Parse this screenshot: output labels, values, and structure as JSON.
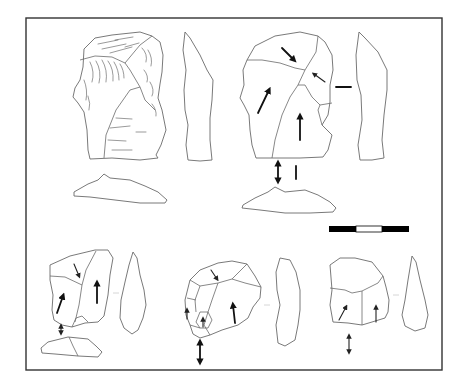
{
  "figure": {
    "type": "lithic-illustration",
    "frame": {
      "x": 26,
      "y": 18,
      "width": 416,
      "height": 352,
      "stroke": "#333333"
    },
    "scale_bar": {
      "x": 329,
      "y": 226,
      "width": 80,
      "height": 6,
      "segments": [
        {
          "color": "#000000"
        },
        {
          "color": "#ffffff"
        },
        {
          "color": "#000000"
        }
      ]
    },
    "artifacts": [
      {
        "id": "artifact-1",
        "views": [
          "dorsal-shaded",
          "lateral-profile",
          "platform"
        ],
        "style": "stippled/shaded"
      },
      {
        "id": "artifact-2",
        "views": [
          "dorsal-scar-pattern",
          "lateral-profile",
          "platform"
        ],
        "arrows": 4,
        "orientation_markers": [
          "double-arrow",
          "vertical-bar",
          "horizontal-bar"
        ]
      },
      {
        "id": "artifact-3",
        "views": [
          "dorsal-scar-pattern",
          "lateral-profile",
          "platform"
        ],
        "arrows": 3,
        "orientation_markers": [
          "double-arrow"
        ]
      },
      {
        "id": "artifact-4",
        "views": [
          "dorsal-scar-pattern",
          "lateral-profile"
        ],
        "arrows": 4,
        "orientation_markers": [
          "double-arrow"
        ]
      },
      {
        "id": "artifact-5",
        "views": [
          "dorsal-scar-pattern",
          "lateral-profile"
        ],
        "arrows": 2,
        "orientation_markers": [
          "double-arrow"
        ]
      }
    ]
  },
  "colors": {
    "background": "#ffffff",
    "line": "#6a6a6a",
    "arrow": "#111111"
  }
}
